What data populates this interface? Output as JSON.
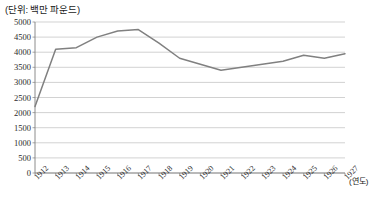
{
  "chart_data": {
    "type": "line",
    "title": "",
    "unit_note": "(단위: 백만 파운드)",
    "xlabel": "(연도)",
    "ylabel": "",
    "categories": [
      "1912",
      "1913",
      "1914",
      "1915",
      "1916",
      "1917",
      "1918",
      "1919",
      "1920",
      "1921",
      "1922",
      "1923",
      "1924",
      "1925",
      "1926",
      "1927"
    ],
    "values": [
      2200,
      4100,
      4150,
      4500,
      4700,
      4750,
      4300,
      3800,
      3600,
      3400,
      3500,
      3600,
      3700,
      3900,
      3800,
      3950
    ],
    "series": [
      {
        "name": "",
        "values": [
          2200,
          4100,
          4150,
          4500,
          4700,
          4750,
          4300,
          3800,
          3600,
          3400,
          3500,
          3600,
          3700,
          3900,
          3800,
          3950
        ]
      }
    ],
    "ylim": [
      0,
      5000
    ],
    "yticks": [
      0,
      500,
      1000,
      1500,
      2000,
      2500,
      3000,
      3500,
      4000,
      4500,
      5000
    ],
    "ytick_labels": [
      "0",
      "500",
      "1000",
      "1500",
      "2000",
      "2500",
      "3000",
      "3500",
      "4000",
      "4500",
      "5000"
    ],
    "grid": true,
    "grid_axis": "y",
    "legend": false,
    "legend_position": "none",
    "line_color": "#808080",
    "grid_color": "#bfbfbf",
    "axis_color": "#808080",
    "background": "#ffffff"
  }
}
